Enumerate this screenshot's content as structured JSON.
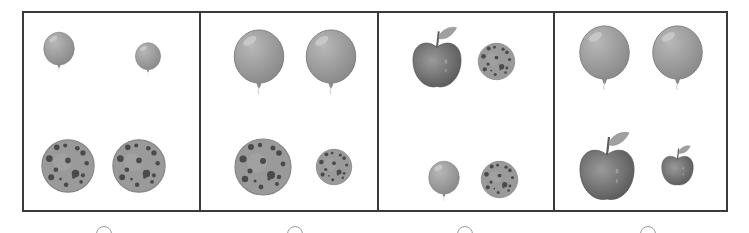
{
  "question": {
    "options": [
      {
        "id": "A",
        "items": [
          {
            "type": "balloon",
            "size": "large",
            "x": 18,
            "y": 10,
            "w": 34,
            "h": 58
          },
          {
            "type": "balloon",
            "size": "small",
            "x": 110,
            "y": 26,
            "w": 28,
            "h": 40
          },
          {
            "type": "cookie",
            "size": "large",
            "x": 16,
            "y": 124,
            "w": 56,
            "h": 58
          },
          {
            "type": "cookie",
            "size": "large",
            "x": 87,
            "y": 124,
            "w": 56,
            "h": 58
          }
        ]
      },
      {
        "id": "B",
        "items": [
          {
            "type": "balloon",
            "size": "large",
            "x": 30,
            "y": 16,
            "w": 56,
            "h": 66
          },
          {
            "type": "balloon",
            "size": "large",
            "x": 102,
            "y": 16,
            "w": 56,
            "h": 66
          },
          {
            "type": "cookie",
            "size": "large",
            "x": 32,
            "y": 124,
            "w": 60,
            "h": 60
          },
          {
            "type": "cookie",
            "size": "small",
            "x": 114,
            "y": 135,
            "w": 38,
            "h": 38
          }
        ]
      },
      {
        "id": "C",
        "items": [
          {
            "type": "apple",
            "size": "large",
            "x": 31,
            "y": 13,
            "w": 54,
            "h": 64
          },
          {
            "type": "cookie",
            "size": "small",
            "x": 98,
            "y": 28,
            "w": 39,
            "h": 41
          },
          {
            "type": "balloon",
            "size": "small",
            "x": 48,
            "y": 144,
            "w": 34,
            "h": 48
          },
          {
            "type": "cookie",
            "size": "small",
            "x": 101,
            "y": 146,
            "w": 39,
            "h": 41
          }
        ]
      },
      {
        "id": "D",
        "items": [
          {
            "type": "balloon",
            "size": "large",
            "x": 22,
            "y": 11,
            "w": 55,
            "h": 68
          },
          {
            "type": "balloon",
            "size": "large",
            "x": 95,
            "y": 11,
            "w": 55,
            "h": 68
          },
          {
            "type": "apple",
            "size": "large",
            "x": 22,
            "y": 117,
            "w": 60,
            "h": 74
          },
          {
            "type": "apple",
            "size": "small",
            "x": 105,
            "y": 132,
            "w": 35,
            "h": 42
          }
        ]
      }
    ],
    "radio_positions": [
      96,
      287,
      457,
      640
    ]
  },
  "colors": {
    "border": "#3a3a3a",
    "radio": "#9a9a9a",
    "balloon": "#8c8c8c",
    "cookie": "#9a9a9a",
    "chip": "#4a4a4a",
    "apple": "#7a7a7a",
    "leaf": "#a0a0a0"
  }
}
